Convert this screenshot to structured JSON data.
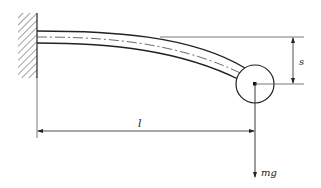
{
  "diagram": {
    "type": "cantilever beam with end mass",
    "labels": {
      "deflection": "s",
      "length": "l",
      "force": "mg"
    },
    "colors": {
      "stroke": "#222222",
      "background": "#ffffff"
    },
    "elements": [
      "fixed-wall-support",
      "flexible-beam",
      "beam-centerline",
      "end-mass-circle",
      "deflection-dimension-s",
      "length-dimension-l",
      "gravity-force-arrow-mg"
    ]
  }
}
